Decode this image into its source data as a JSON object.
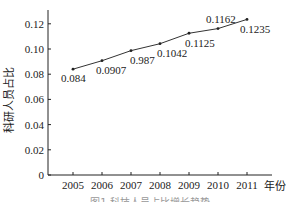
{
  "chart_data": {
    "type": "line",
    "title": "",
    "xlabel": "年份",
    "ylabel": "科研人员占比",
    "categories": [
      "2005",
      "2006",
      "2007",
      "2008",
      "2009",
      "2010",
      "2011"
    ],
    "series": [
      {
        "name": "科研人员占比",
        "values": [
          0.084,
          0.0907,
          0.0987,
          0.1042,
          0.1125,
          0.1162,
          0.1235
        ]
      }
    ],
    "data_labels": [
      "0.084",
      "0.0907",
      "0.987",
      "0.1042",
      "0.1125",
      "0.1162",
      "0.1235"
    ],
    "yticks": [
      "0",
      "0.02",
      "0.04",
      "0.06",
      "0.08",
      "0.10",
      "0.12"
    ],
    "ylim": [
      0,
      0.13
    ],
    "grid": false,
    "legend": "none",
    "caption": "图1  科技人员占比增长趋势"
  },
  "colors": {
    "line": "#333333",
    "axis": "#222222",
    "text": "#222222"
  }
}
